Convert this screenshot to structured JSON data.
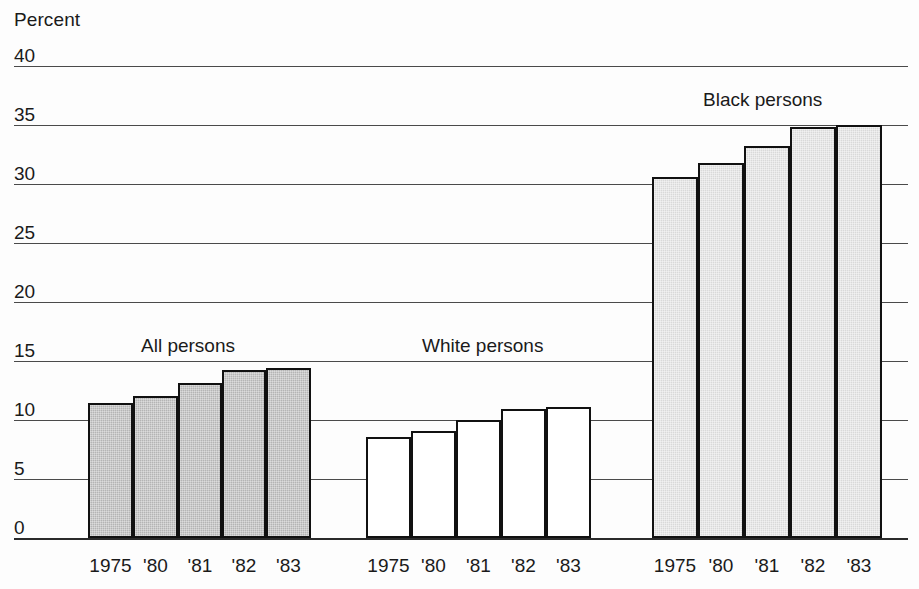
{
  "chart_data": {
    "type": "bar",
    "title": "",
    "subtitle": "",
    "xlabel": "",
    "ylabel": "Percent",
    "ylim": [
      0,
      40
    ],
    "ytick_values": [
      40,
      35,
      30,
      25,
      20,
      15,
      10,
      5,
      0
    ],
    "ytick_labels": [
      "40",
      "35",
      "30",
      "25",
      "20",
      "15",
      "10",
      "5",
      "0"
    ],
    "grid": true,
    "legend_position": "inline-group-labels",
    "categories": [
      "1975",
      "'80",
      "'81",
      "'82",
      "'83"
    ],
    "series": [
      {
        "name": "All persons",
        "values": [
          11.4,
          12.0,
          13.1,
          14.2,
          14.4
        ],
        "fill": "#b4b4b4",
        "fill_style": "shaded-dark"
      },
      {
        "name": "White persons",
        "values": [
          8.6,
          9.1,
          10.0,
          10.9,
          11.1
        ],
        "fill": "#ffffff",
        "fill_style": "hollow"
      },
      {
        "name": "Black persons",
        "values": [
          30.6,
          31.8,
          33.2,
          34.8,
          35.0
        ],
        "fill": "#d9d9d9",
        "fill_style": "shaded-light"
      }
    ],
    "annotations": [
      "All persons",
      "White persons",
      "Black persons"
    ],
    "colors": {
      "axis": "#1a1a1a",
      "gridline": "#4a4a4a",
      "bar_outline": "#111111",
      "background": "#fdfdfd"
    }
  },
  "group_labels": [
    {
      "text": "All persons",
      "left": 141,
      "top": 336
    },
    {
      "text": "White persons",
      "left": 422,
      "top": 336
    },
    {
      "text": "Black persons",
      "left": 703,
      "top": 90
    }
  ],
  "groups": [
    {
      "name": "All persons",
      "style": "shaded-dark",
      "bars": [
        {
          "label": "1975",
          "value": 11.4,
          "x": 88,
          "w": 45
        },
        {
          "label": "'80",
          "value": 12.0,
          "x": 133,
          "w": 45
        },
        {
          "label": "'81",
          "value": 13.1,
          "x": 178,
          "w": 44
        },
        {
          "label": "'82",
          "value": 14.2,
          "x": 222,
          "w": 44
        },
        {
          "label": "'83",
          "value": 14.4,
          "x": 266,
          "w": 45
        }
      ]
    },
    {
      "name": "White persons",
      "style": "hollow",
      "bars": [
        {
          "label": "1975",
          "value": 8.6,
          "x": 366,
          "w": 45
        },
        {
          "label": "'80",
          "value": 9.1,
          "x": 411,
          "w": 45
        },
        {
          "label": "'81",
          "value": 10.0,
          "x": 456,
          "w": 45
        },
        {
          "label": "'82",
          "value": 10.9,
          "x": 501,
          "w": 45
        },
        {
          "label": "'83",
          "value": 11.1,
          "x": 546,
          "w": 45
        }
      ]
    },
    {
      "name": "Black persons",
      "style": "shaded-light",
      "bars": [
        {
          "label": "1975",
          "value": 30.6,
          "x": 652,
          "w": 46
        },
        {
          "label": "'80",
          "value": 31.8,
          "x": 698,
          "w": 46
        },
        {
          "label": "'81",
          "value": 33.2,
          "x": 744,
          "w": 46
        },
        {
          "label": "'82",
          "value": 34.8,
          "x": 790,
          "w": 46
        },
        {
          "label": "'83",
          "value": 35.0,
          "x": 836,
          "w": 46
        }
      ]
    }
  ],
  "geometry": {
    "baseline_y": 538,
    "top_y": 66,
    "grid_left": 14,
    "grid_width": 894,
    "value_max": 40
  }
}
